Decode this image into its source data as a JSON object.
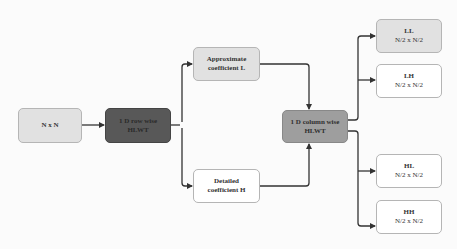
{
  "diagram": {
    "type": "flowchart",
    "direction": "left-to-right",
    "nodes": {
      "input": {
        "label": "N x N",
        "fill": "#e1e1e1"
      },
      "row_hlwt": {
        "line1": "1 D row wise",
        "line2": "HLWT",
        "fill": "#585858"
      },
      "approx": {
        "line1": "Approximate",
        "line2": "coefficient L",
        "fill": "#e1e1e1"
      },
      "detail": {
        "line1": "Detailed",
        "line2": "coefficient H",
        "fill": "#ffffff"
      },
      "col_hlwt": {
        "line1": "1 D column wise",
        "line2": "HLWT",
        "fill": "#9e9e9e"
      },
      "ll": {
        "title": "LL",
        "size": "N/2 x N/2",
        "fill": "#e1e1e1"
      },
      "lh": {
        "title": "LH",
        "size": "N/2 x N/2",
        "fill": "#ffffff"
      },
      "hl": {
        "title": "HL",
        "size": "N/2 x N/2",
        "fill": "#ffffff"
      },
      "hh": {
        "title": "HH",
        "size": "N/2 x N/2",
        "fill": "#ffffff"
      }
    },
    "edges": [
      [
        "N x N",
        "1 D row wise HLWT"
      ],
      [
        "1 D row wise HLWT",
        "Approximate coefficient L"
      ],
      [
        "1 D row wise HLWT",
        "Detailed coefficient H"
      ],
      [
        "Approximate coefficient L",
        "1 D column wise HLWT"
      ],
      [
        "Detailed coefficient H",
        "1 D column wise HLWT"
      ],
      [
        "1 D column wise HLWT",
        "LL"
      ],
      [
        "1 D column wise HLWT",
        "LH"
      ],
      [
        "1 D column wise HLWT",
        "HL"
      ],
      [
        "1 D column wise HLWT",
        "HH"
      ]
    ],
    "line_color": "#333333"
  }
}
